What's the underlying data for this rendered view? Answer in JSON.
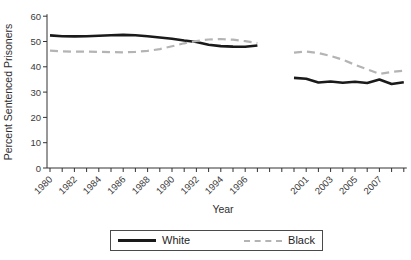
{
  "chart_data": {
    "type": "line",
    "title": "",
    "xlabel": "Year",
    "ylabel": "Percent Sentenced Prisoners",
    "ylim": [
      0,
      60
    ],
    "yticks": [
      0,
      10,
      20,
      30,
      40,
      50,
      60
    ],
    "grid": false,
    "legend_position": "bottom",
    "x": [
      1980,
      1981,
      1982,
      1983,
      1984,
      1985,
      1986,
      1987,
      1988,
      1989,
      1990,
      1991,
      1992,
      1993,
      1994,
      1995,
      1996,
      1997,
      1998,
      1999,
      2000,
      2001,
      2002,
      2003,
      2004,
      2005,
      2006,
      2007,
      2008,
      2009
    ],
    "x_tick_labels_shown": [
      "1980",
      "1982",
      "1984",
      "1986",
      "1988",
      "1990",
      "1992",
      "1994",
      "1996",
      "2001",
      "2003",
      "2005",
      "2007"
    ],
    "data_gap_years": [
      1998,
      1999
    ],
    "series": [
      {
        "name": "White",
        "style": "solid",
        "color": "#1a1a1a",
        "values": [
          52.4,
          52.1,
          52.0,
          52.1,
          52.3,
          52.5,
          52.6,
          52.5,
          52.1,
          51.6,
          51.1,
          50.4,
          49.8,
          48.7,
          48.2,
          48.0,
          47.9,
          48.4,
          null,
          null,
          35.6,
          35.3,
          33.8,
          34.2,
          33.7,
          34.1,
          33.6,
          35.0,
          33.2,
          33.9
        ]
      },
      {
        "name": "Black",
        "style": "dashed",
        "color": "#b4b4b4",
        "values": [
          46.4,
          46.1,
          46.0,
          46.0,
          45.9,
          45.8,
          45.7,
          45.9,
          46.3,
          47.0,
          48.1,
          49.3,
          50.2,
          50.8,
          51.0,
          50.7,
          50.1,
          49.4,
          null,
          null,
          45.6,
          46.0,
          45.4,
          44.3,
          42.8,
          40.8,
          39.0,
          37.2,
          38.0,
          38.5
        ]
      }
    ]
  }
}
